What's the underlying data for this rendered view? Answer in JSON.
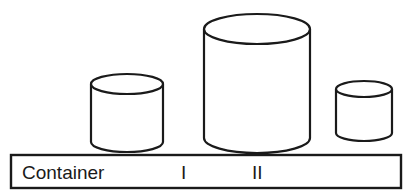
{
  "diagram": {
    "stroke_color": "#1a1a1a",
    "fill_color": "#ffffff",
    "labels": {
      "row_header": "Container",
      "container_1": "I",
      "container_2": "II",
      "container_3": ""
    },
    "containers": [
      {
        "id": "I",
        "label": "I",
        "size": "medium"
      },
      {
        "id": "II",
        "label": "II",
        "size": "large"
      },
      {
        "id": "III",
        "label": "",
        "size": "small"
      }
    ]
  }
}
